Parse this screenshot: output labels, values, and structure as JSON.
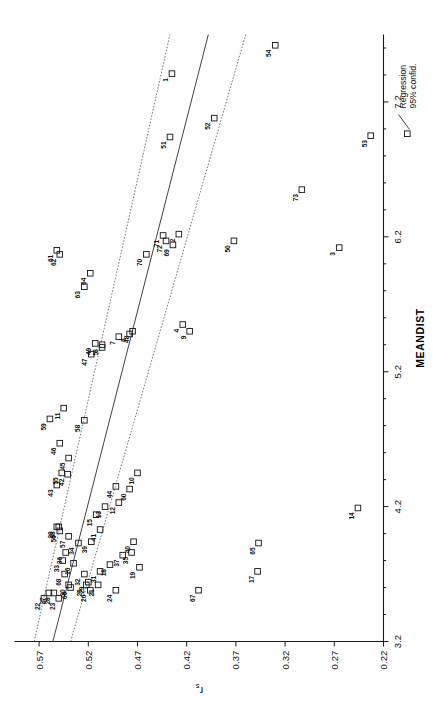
{
  "figure": {
    "xlabel": "MEANDIST",
    "ylabel_main": "r",
    "ylabel_sub": "s"
  },
  "legend": {
    "items": [
      {
        "label": "Regression",
        "key": "line"
      },
      {
        "label": "95% confid.",
        "key": "dashed-line"
      }
    ],
    "marker_icon": "open-square-marker-icon",
    "line_icon": "regression-line-icon"
  },
  "chart_data": {
    "type": "scatter",
    "title": "",
    "xlabel": "MEANDIST",
    "ylabel": "r_s",
    "xlim": [
      3.2,
      7.7
    ],
    "ylim": [
      0.22,
      0.595
    ],
    "xticks": [
      "3.2",
      "4.2",
      "5.2",
      "6.2",
      "7.2"
    ],
    "xtick_values": [
      3.2,
      4.2,
      5.2,
      6.2,
      7.2
    ],
    "yticks": [
      "0.22",
      "0.27",
      "0.32",
      "0.37",
      "0.42",
      "0.47",
      "0.52",
      "0.57"
    ],
    "ytick_values": [
      0.22,
      0.27,
      0.32,
      0.37,
      0.42,
      0.47,
      0.52,
      0.57
    ],
    "grid": false,
    "legend_position": "bottom-right",
    "marker": "open square",
    "series": [
      {
        "name": "observations",
        "point_labels": [
          "1",
          "2",
          "3",
          "4",
          "5",
          "6",
          "7",
          "8",
          "9",
          "10",
          "11",
          "12",
          "13",
          "14",
          "15",
          "16",
          "17",
          "18",
          "19",
          "20",
          "21",
          "22",
          "23",
          "24",
          "25",
          "26",
          "27",
          "28",
          "29",
          "30",
          "31",
          "32",
          "33",
          "34",
          "35",
          "36",
          "37",
          "38",
          "39",
          "40",
          "41",
          "42",
          "43",
          "44",
          "45",
          "46",
          "47",
          "48",
          "49",
          "50",
          "51",
          "52",
          "53",
          "54",
          "55",
          "56",
          "57",
          "58",
          "59",
          "60",
          "61",
          "62",
          "63",
          "64",
          "65",
          "66",
          "67",
          "68",
          "69",
          "70",
          "71",
          "72",
          "73"
        ],
        "points": [
          {
            "label": "1",
            "x": 7.41,
            "y": 0.435
          },
          {
            "label": "2",
            "x": 6.22,
            "y": 0.428
          },
          {
            "label": "3",
            "x": 6.12,
            "y": 0.265
          },
          {
            "label": "4",
            "x": 5.55,
            "y": 0.424
          },
          {
            "label": "5",
            "x": 5.38,
            "y": 0.506
          },
          {
            "label": "6",
            "x": 5.48,
            "y": 0.478
          },
          {
            "label": "7",
            "x": 5.46,
            "y": 0.489
          },
          {
            "label": "8",
            "x": 5.4,
            "y": 0.506
          },
          {
            "label": "9",
            "x": 5.5,
            "y": 0.417
          },
          {
            "label": "10",
            "x": 4.45,
            "y": 0.47
          },
          {
            "label": "11",
            "x": 4.93,
            "y": 0.545
          },
          {
            "label": "12",
            "x": 4.23,
            "y": 0.489
          },
          {
            "label": "13",
            "x": 4.2,
            "y": 0.503
          },
          {
            "label": "14",
            "x": 4.19,
            "y": 0.246
          },
          {
            "label": "15",
            "x": 4.14,
            "y": 0.512
          },
          {
            "label": "16",
            "x": 3.78,
            "y": 0.535
          },
          {
            "label": "17",
            "x": 3.72,
            "y": 0.348
          },
          {
            "label": "18",
            "x": 3.77,
            "y": 0.498
          },
          {
            "label": "19",
            "x": 3.75,
            "y": 0.468
          },
          {
            "label": "20",
            "x": 4.05,
            "y": 0.552
          },
          {
            "label": "21",
            "x": 3.62,
            "y": 0.51
          },
          {
            "label": "22",
            "x": 3.52,
            "y": 0.565
          },
          {
            "label": "23",
            "x": 3.52,
            "y": 0.55
          },
          {
            "label": "24",
            "x": 3.58,
            "y": 0.492
          },
          {
            "label": "25",
            "x": 3.62,
            "y": 0.522
          },
          {
            "label": "26",
            "x": 3.58,
            "y": 0.518
          },
          {
            "label": "27",
            "x": 3.56,
            "y": 0.56
          },
          {
            "label": "28",
            "x": 3.56,
            "y": 0.555
          },
          {
            "label": "29",
            "x": 3.64,
            "y": 0.52
          },
          {
            "label": "30",
            "x": 3.62,
            "y": 0.54
          },
          {
            "label": "31",
            "x": 3.72,
            "y": 0.508
          },
          {
            "label": "32",
            "x": 3.7,
            "y": 0.524
          },
          {
            "label": "33",
            "x": 3.8,
            "y": 0.546
          },
          {
            "label": "34",
            "x": 3.93,
            "y": 0.53
          },
          {
            "label": "35",
            "x": 3.86,
            "y": 0.476
          },
          {
            "label": "36",
            "x": 3.86,
            "y": 0.543
          },
          {
            "label": "37",
            "x": 3.84,
            "y": 0.485
          },
          {
            "label": "38",
            "x": 4.05,
            "y": 0.55
          },
          {
            "label": "39",
            "x": 3.94,
            "y": 0.517
          },
          {
            "label": "40",
            "x": 3.94,
            "y": 0.474
          },
          {
            "label": "41",
            "x": 4.03,
            "y": 0.508
          },
          {
            "label": "42",
            "x": 4.44,
            "y": 0.541
          },
          {
            "label": "43",
            "x": 4.36,
            "y": 0.552
          },
          {
            "label": "44",
            "x": 4.35,
            "y": 0.492
          },
          {
            "label": "45",
            "x": 4.56,
            "y": 0.54
          },
          {
            "label": "46",
            "x": 4.67,
            "y": 0.549
          },
          {
            "label": "47",
            "x": 5.33,
            "y": 0.517
          },
          {
            "label": "48",
            "x": 5.5,
            "y": 0.475
          },
          {
            "label": "49",
            "x": 5.41,
            "y": 0.513
          },
          {
            "label": "50",
            "x": 6.17,
            "y": 0.372
          },
          {
            "label": "51",
            "x": 6.94,
            "y": 0.437
          },
          {
            "label": "52",
            "x": 7.08,
            "y": 0.392
          },
          {
            "label": "53",
            "x": 6.95,
            "y": 0.233
          },
          {
            "label": "54",
            "x": 7.62,
            "y": 0.33
          },
          {
            "label": "55",
            "x": 4.45,
            "y": 0.547
          },
          {
            "label": "56",
            "x": 4.02,
            "y": 0.549
          },
          {
            "label": "57",
            "x": 3.98,
            "y": 0.54
          },
          {
            "label": "58",
            "x": 4.84,
            "y": 0.524
          },
          {
            "label": "59",
            "x": 4.85,
            "y": 0.559
          },
          {
            "label": "60",
            "x": 4.33,
            "y": 0.478
          },
          {
            "label": "61",
            "x": 6.1,
            "y": 0.552
          },
          {
            "label": "62",
            "x": 6.07,
            "y": 0.549
          },
          {
            "label": "63",
            "x": 5.83,
            "y": 0.524
          },
          {
            "label": "64",
            "x": 5.93,
            "y": 0.518
          },
          {
            "label": "65",
            "x": 3.93,
            "y": 0.347
          },
          {
            "label": "66",
            "x": 3.6,
            "y": 0.538
          },
          {
            "label": "67",
            "x": 3.58,
            "y": 0.408
          },
          {
            "label": "68",
            "x": 3.7,
            "y": 0.544
          },
          {
            "label": "69",
            "x": 6.14,
            "y": 0.434
          },
          {
            "label": "70",
            "x": 6.07,
            "y": 0.461
          },
          {
            "label": "71",
            "x": 6.21,
            "y": 0.444
          },
          {
            "label": "72",
            "x": 6.17,
            "y": 0.441
          },
          {
            "label": "73",
            "x": 6.55,
            "y": 0.303
          }
        ]
      }
    ],
    "fit": {
      "name": "Regression",
      "type": "linear",
      "x_start": 3.2,
      "x_end": 7.7,
      "y_start": 0.556,
      "y_end": 0.398
    },
    "confidence_bands": {
      "name": "95% confid.",
      "upper": {
        "x_start": 3.2,
        "y_start": 0.575,
        "x_end": 7.7,
        "y_end": 0.437
      },
      "lower": {
        "x_start": 3.2,
        "y_start": 0.538,
        "x_end": 7.7,
        "y_end": 0.36
      }
    }
  }
}
